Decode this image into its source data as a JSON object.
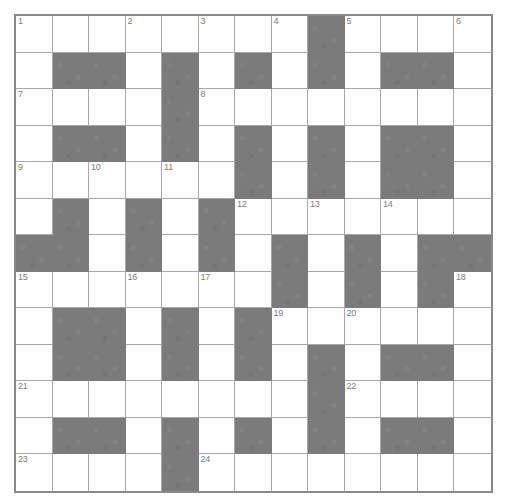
{
  "puzzle": {
    "title": "Crossword Grid",
    "rows": 13,
    "cols": 13,
    "cell_size_px": 36.5,
    "colors": {
      "block": "#7b7b7b",
      "open": "#ffffff",
      "gridline": "#a9a9a9",
      "border": "#8a8a8a",
      "number_text": "#7d7d7d"
    },
    "grid": [
      [
        "open",
        "open",
        "open",
        "open",
        "open",
        "open",
        "open",
        "open",
        "block",
        "open",
        "open",
        "open",
        "open"
      ],
      [
        "open",
        "block",
        "block",
        "open",
        "block",
        "open",
        "block",
        "open",
        "block",
        "open",
        "block",
        "block",
        "open"
      ],
      [
        "open",
        "open",
        "open",
        "open",
        "block",
        "open",
        "open",
        "open",
        "open",
        "open",
        "open",
        "open",
        "open"
      ],
      [
        "open",
        "block",
        "block",
        "open",
        "block",
        "open",
        "block",
        "open",
        "block",
        "open",
        "block",
        "block",
        "open"
      ],
      [
        "open",
        "open",
        "open",
        "open",
        "open",
        "open",
        "block",
        "open",
        "block",
        "open",
        "block",
        "block",
        "open"
      ],
      [
        "open",
        "block",
        "open",
        "block",
        "open",
        "block",
        "open",
        "open",
        "open",
        "open",
        "open",
        "open",
        "open"
      ],
      [
        "block",
        "block",
        "open",
        "block",
        "open",
        "block",
        "open",
        "block",
        "open",
        "block",
        "open",
        "block",
        "block"
      ],
      [
        "open",
        "open",
        "open",
        "open",
        "open",
        "open",
        "open",
        "block",
        "open",
        "block",
        "open",
        "block",
        "open"
      ],
      [
        "open",
        "block",
        "block",
        "open",
        "block",
        "open",
        "block",
        "open",
        "open",
        "open",
        "open",
        "open",
        "open"
      ],
      [
        "open",
        "block",
        "block",
        "open",
        "block",
        "open",
        "block",
        "open",
        "block",
        "open",
        "block",
        "block",
        "open"
      ],
      [
        "open",
        "open",
        "open",
        "open",
        "open",
        "open",
        "open",
        "open",
        "block",
        "open",
        "open",
        "open",
        "open"
      ],
      [
        "open",
        "block",
        "block",
        "open",
        "block",
        "open",
        "block",
        "open",
        "block",
        "open",
        "block",
        "block",
        "open"
      ],
      [
        "open",
        "open",
        "open",
        "open",
        "block",
        "open",
        "open",
        "open",
        "open",
        "open",
        "open",
        "open",
        "open"
      ]
    ],
    "numbers": [
      {
        "row": 0,
        "col": 0,
        "label": "1"
      },
      {
        "row": 0,
        "col": 3,
        "label": "2"
      },
      {
        "row": 0,
        "col": 5,
        "label": "3"
      },
      {
        "row": 0,
        "col": 7,
        "label": "4"
      },
      {
        "row": 0,
        "col": 9,
        "label": "5"
      },
      {
        "row": 0,
        "col": 12,
        "label": "6"
      },
      {
        "row": 2,
        "col": 0,
        "label": "7"
      },
      {
        "row": 2,
        "col": 5,
        "label": "8"
      },
      {
        "row": 4,
        "col": 0,
        "label": "9"
      },
      {
        "row": 4,
        "col": 2,
        "label": "10"
      },
      {
        "row": 4,
        "col": 4,
        "label": "11"
      },
      {
        "row": 5,
        "col": 6,
        "label": "12"
      },
      {
        "row": 5,
        "col": 8,
        "label": "13"
      },
      {
        "row": 5,
        "col": 10,
        "label": "14"
      },
      {
        "row": 7,
        "col": 0,
        "label": "15"
      },
      {
        "row": 7,
        "col": 3,
        "label": "16"
      },
      {
        "row": 7,
        "col": 5,
        "label": "17"
      },
      {
        "row": 7,
        "col": 12,
        "label": "18"
      },
      {
        "row": 8,
        "col": 7,
        "label": "19"
      },
      {
        "row": 8,
        "col": 9,
        "label": "20"
      },
      {
        "row": 10,
        "col": 0,
        "label": "21"
      },
      {
        "row": 10,
        "col": 9,
        "label": "22"
      },
      {
        "row": 12,
        "col": 0,
        "label": "23"
      },
      {
        "row": 12,
        "col": 5,
        "label": "24"
      }
    ],
    "entries": []
  }
}
